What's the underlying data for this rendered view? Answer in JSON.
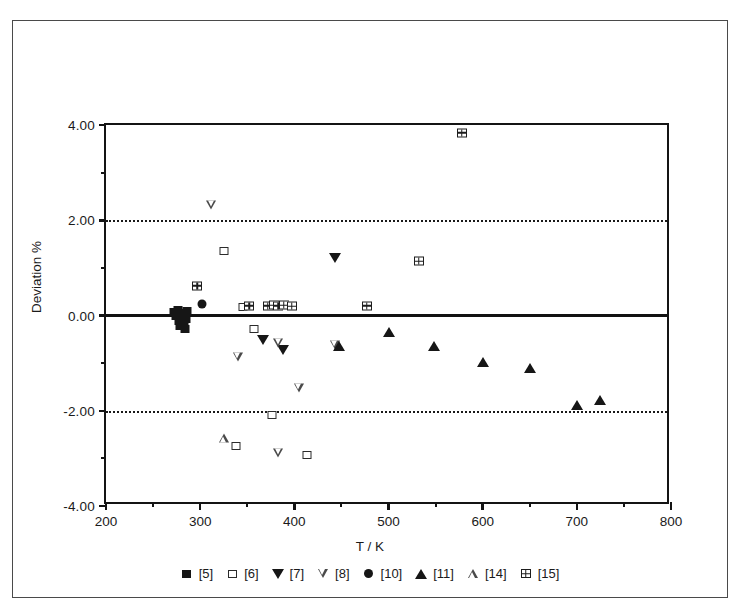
{
  "figure": {
    "x_axis_title": "T / K",
    "y_axis_title": "Deviation %"
  },
  "chart_data": {
    "type": "scatter",
    "title": "",
    "xlabel": "T / K",
    "ylabel": "Deviation %",
    "xlim": [
      200,
      800
    ],
    "ylim": [
      -4.0,
      4.0
    ],
    "xticks": [
      200,
      300,
      400,
      500,
      600,
      700,
      800
    ],
    "xtick_labels": [
      "200",
      "300",
      "400",
      "500",
      "600",
      "700",
      "800"
    ],
    "xticks_minor": [
      250,
      350,
      450,
      550,
      650,
      750
    ],
    "yticks": [
      4.0,
      2.0,
      0.0,
      -2.0,
      -4.0
    ],
    "ytick_labels": [
      "4.00",
      "2.00",
      "0.00",
      "-2.00",
      "-4.00"
    ],
    "yticks_minor": [
      3.0,
      1.0,
      -1.0,
      -3.0
    ],
    "grid": "dotted horizontal lines at +2.00 and -2.00; solid heavy line at 0.00",
    "gridlines_dotted": [
      2.0,
      -2.0
    ],
    "zero_line": 0.0,
    "legend_position": "below-axes",
    "series": [
      {
        "name": "[5]",
        "marker": "filled-square",
        "points": [
          {
            "x": 272,
            "y": 0.08
          },
          {
            "x": 274,
            "y": -0.02
          },
          {
            "x": 276,
            "y": 0.12
          },
          {
            "x": 277,
            "y": -0.12
          },
          {
            "x": 278,
            "y": 0.02
          },
          {
            "x": 279,
            "y": -0.22
          },
          {
            "x": 281,
            "y": -0.05
          },
          {
            "x": 282,
            "y": 0.06
          },
          {
            "x": 283,
            "y": -0.18
          },
          {
            "x": 284,
            "y": -0.28
          },
          {
            "x": 285,
            "y": -0.08
          },
          {
            "x": 286,
            "y": 0.1
          }
        ]
      },
      {
        "name": "[6]",
        "marker": "open-square",
        "points": [
          {
            "x": 325,
            "y": 1.35
          },
          {
            "x": 345,
            "y": 0.18
          },
          {
            "x": 357,
            "y": -0.28
          },
          {
            "x": 376,
            "y": -2.08
          },
          {
            "x": 338,
            "y": -2.75
          },
          {
            "x": 413,
            "y": -2.92
          }
        ]
      },
      {
        "name": "[7]",
        "marker": "filled-down-triangle",
        "points": [
          {
            "x": 367,
            "y": -0.52
          },
          {
            "x": 388,
            "y": -0.73
          },
          {
            "x": 443,
            "y": 1.21
          }
        ]
      },
      {
        "name": "[8]",
        "marker": "open-down-triangle",
        "points": [
          {
            "x": 312,
            "y": 2.32
          },
          {
            "x": 340,
            "y": -0.88
          },
          {
            "x": 383,
            "y": -0.58
          },
          {
            "x": 405,
            "y": -1.52
          },
          {
            "x": 383,
            "y": -2.88
          },
          {
            "x": 443,
            "y": -0.62
          }
        ]
      },
      {
        "name": "[10]",
        "marker": "filled-circle",
        "points": [
          {
            "x": 302,
            "y": 0.25
          }
        ]
      },
      {
        "name": "[11]",
        "marker": "filled-up-triangle",
        "points": [
          {
            "x": 447,
            "y": -0.63
          },
          {
            "x": 500,
            "y": -0.35
          },
          {
            "x": 548,
            "y": -0.65
          },
          {
            "x": 600,
            "y": -0.98
          },
          {
            "x": 650,
            "y": -1.11
          },
          {
            "x": 700,
            "y": -1.88
          },
          {
            "x": 725,
            "y": -1.78
          }
        ]
      },
      {
        "name": "[14]",
        "marker": "open-up-triangle",
        "points": [
          {
            "x": 325,
            "y": -2.58
          }
        ]
      },
      {
        "name": "[15]",
        "marker": "gridded-square",
        "points": [
          {
            "x": 297,
            "y": 0.62
          },
          {
            "x": 352,
            "y": 0.2
          },
          {
            "x": 372,
            "y": 0.2
          },
          {
            "x": 378,
            "y": 0.21
          },
          {
            "x": 383,
            "y": 0.2
          },
          {
            "x": 389,
            "y": 0.22
          },
          {
            "x": 397,
            "y": 0.19
          },
          {
            "x": 477,
            "y": 0.2
          },
          {
            "x": 532,
            "y": 1.14
          },
          {
            "x": 578,
            "y": 3.84
          }
        ]
      }
    ]
  },
  "legend": {
    "items": [
      {
        "label": "[5]",
        "marker": "filled-square"
      },
      {
        "label": "[6]",
        "marker": "open-square"
      },
      {
        "label": "[7]",
        "marker": "filled-down-triangle"
      },
      {
        "label": "[8]",
        "marker": "open-down-triangle"
      },
      {
        "label": "[10]",
        "marker": "filled-circle"
      },
      {
        "label": "[11]",
        "marker": "filled-up-triangle"
      },
      {
        "label": "[14]",
        "marker": "open-up-triangle"
      },
      {
        "label": "[15]",
        "marker": "gridded-square"
      }
    ]
  }
}
